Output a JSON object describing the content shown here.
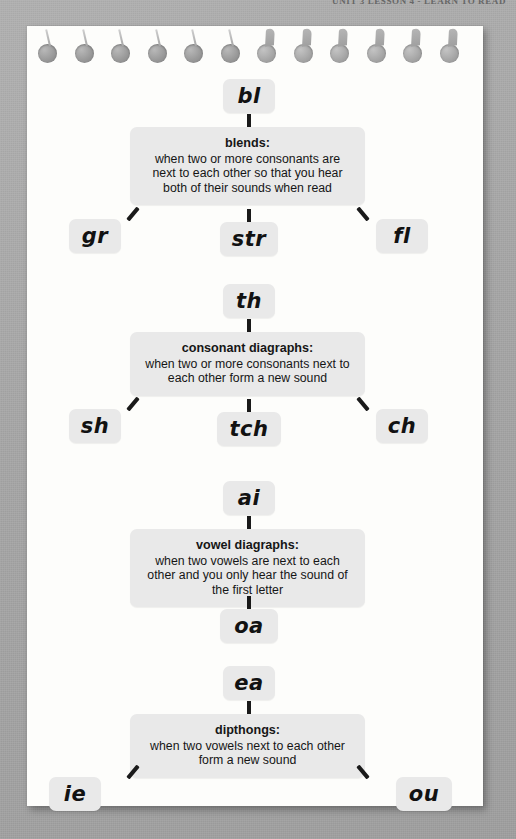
{
  "header": {
    "clipped_text": "UNIT 3 LESSON 4 - LEARN TO READ"
  },
  "notepad": {
    "hole_count": 12
  },
  "diagram": {
    "sections": [
      {
        "id": "blends",
        "top_label": "bl",
        "def_title": "blends:",
        "def_body": "when two or more consonants are next to each other so that you hear both of their sounds when read",
        "left_label": "gr",
        "center_label": "str",
        "right_label": "fl"
      },
      {
        "id": "consonant-diagraphs",
        "top_label": "th",
        "def_title": "consonant diagraphs:",
        "def_body": "when two or more consonants next to each other form a new sound",
        "left_label": "sh",
        "center_label": "tch",
        "right_label": "ch"
      },
      {
        "id": "vowel-diagraphs",
        "top_label": "ai",
        "def_title": "vowel diagraphs:",
        "def_body": "when two vowels are next to each other and you only hear the sound of the first letter",
        "left_label": "",
        "center_label": "oa",
        "right_label": ""
      },
      {
        "id": "dipthongs",
        "top_label": "ea",
        "def_title": "dipthongs:",
        "def_body": "when two vowels next to each other form a new sound",
        "left_label": "ie",
        "center_label": "",
        "right_label": "ou"
      }
    ]
  },
  "colors": {
    "backdrop": "#a8a8a8",
    "page": "#fdfdfb",
    "node_fill": "#e9e9e9",
    "text": "#121212",
    "connector": "#1a1a1a"
  }
}
